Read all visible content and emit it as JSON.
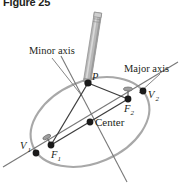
{
  "figure": {
    "title": "Figure 25",
    "caption_visible": true
  },
  "diagram": {
    "type": "ellipse-construction",
    "labels": {
      "minor_axis": "Minor axis",
      "major_axis": "Major axis",
      "center": "Center",
      "point_p": "P",
      "vertex_1": "V",
      "vertex_1_sub": "1",
      "vertex_2": "V",
      "vertex_2_sub": "2",
      "focus_1": "F",
      "focus_1_sub": "1",
      "focus_2": "F",
      "focus_2_sub": "2"
    },
    "colors": {
      "ellipse_stroke": "#a6a6a6",
      "axis_stroke": "#6e6e6e",
      "string_stroke": "#404040",
      "point_fill": "#1a1a1a",
      "pencil_body": "#b5b5b5",
      "pencil_edge": "#8a8a8a",
      "text": "#231f20",
      "background": "#ffffff"
    },
    "points": {
      "P": {
        "x": 88,
        "y": 83
      },
      "center": {
        "x": 90,
        "y": 122
      },
      "F1": {
        "x": 51,
        "y": 145
      },
      "F2": {
        "x": 128,
        "y": 99
      },
      "V1": {
        "x": 36,
        "y": 153
      },
      "V2": {
        "x": 143,
        "y": 91
      }
    },
    "ellipse": {
      "cx": 90,
      "cy": 122,
      "rx": 62,
      "ry": 41,
      "rotation_deg": -23
    }
  }
}
